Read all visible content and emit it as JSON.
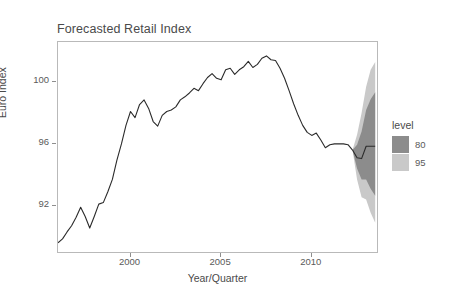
{
  "chart_data": {
    "type": "line",
    "title": "Forecasted Retail Index",
    "xlabel": "Year/Quarter",
    "ylabel": "Euro Index",
    "xlim": [
      1996.0,
      1913.5
    ],
    "x_range": [
      1996.0,
      2013.6
    ],
    "ylim": [
      89.0,
      102.6
    ],
    "xticks": [
      2000,
      2005,
      2010
    ],
    "xtick_labels": [
      "2000",
      "2005",
      "2010"
    ],
    "yticks": [
      92,
      96,
      100
    ],
    "ytick_labels": [
      "92",
      "96",
      "100"
    ],
    "grid": false,
    "legend": {
      "title": "level",
      "position": "right",
      "entries": [
        {
          "label": "80",
          "color": "#8c8c8c"
        },
        {
          "label": "95",
          "color": "#c9c9c9"
        }
      ]
    },
    "series": [
      {
        "name": "Euro Index (historical)",
        "color": "#2b2b2b",
        "x": [
          1996.0,
          1996.25,
          1996.5,
          1996.75,
          1997.0,
          1997.25,
          1997.5,
          1997.75,
          1998.0,
          1998.25,
          1998.5,
          1998.75,
          1999.0,
          1999.25,
          1999.5,
          1999.75,
          2000.0,
          2000.25,
          2000.5,
          2000.75,
          2001.0,
          2001.25,
          2001.5,
          2001.75,
          2002.0,
          2002.25,
          2002.5,
          2002.75,
          2003.0,
          2003.25,
          2003.5,
          2003.75,
          2004.0,
          2004.25,
          2004.5,
          2004.75,
          2005.0,
          2005.25,
          2005.5,
          2005.75,
          2006.0,
          2006.25,
          2006.5,
          2006.75,
          2007.0,
          2007.25,
          2007.5,
          2007.75,
          2008.0,
          2008.25,
          2008.5,
          2008.75,
          2009.0,
          2009.25,
          2009.5,
          2009.75,
          2010.0,
          2010.25,
          2010.5,
          2010.75,
          2011.0,
          2011.25,
          2011.5,
          2011.75,
          2012.0,
          2012.25
        ],
        "y": [
          89.6,
          89.85,
          90.3,
          90.7,
          91.25,
          91.9,
          91.3,
          90.55,
          91.3,
          92.1,
          92.2,
          92.9,
          93.7,
          94.95,
          96.0,
          97.2,
          98.1,
          97.7,
          98.55,
          98.85,
          98.3,
          97.45,
          97.15,
          97.85,
          98.1,
          98.2,
          98.4,
          98.85,
          99.05,
          99.3,
          99.6,
          99.45,
          99.9,
          100.3,
          100.55,
          100.25,
          100.15,
          100.8,
          100.9,
          100.5,
          100.8,
          101.0,
          101.35,
          100.95,
          101.15,
          101.55,
          101.7,
          101.45,
          101.4,
          100.9,
          100.25,
          99.45,
          98.6,
          97.85,
          97.2,
          96.75,
          96.55,
          96.7,
          96.25,
          95.75,
          95.95,
          96.0,
          96.0,
          96.0,
          95.95,
          95.6
        ]
      },
      {
        "name": "Forecast (point)",
        "color": "#2b2b2b",
        "x": [
          2012.25,
          2012.5,
          2012.75,
          2013.0,
          2013.25,
          2013.5
        ],
        "y": [
          95.6,
          95.1,
          95.05,
          95.85,
          95.85,
          95.85
        ]
      }
    ],
    "intervals": [
      {
        "level": 95,
        "color": "#c9c9c9",
        "x": [
          2012.25,
          2012.5,
          2012.75,
          2013.0,
          2013.25,
          2013.5
        ],
        "lower": [
          95.6,
          93.7,
          92.55,
          92.4,
          91.55,
          90.9
        ],
        "upper": [
          95.6,
          96.6,
          98.0,
          99.7,
          100.8,
          101.3
        ]
      },
      {
        "level": 80,
        "color": "#8c8c8c",
        "x": [
          2012.25,
          2012.5,
          2012.75,
          2013.0,
          2013.25,
          2013.5
        ],
        "lower": [
          95.6,
          94.4,
          93.7,
          93.7,
          93.1,
          92.65
        ],
        "upper": [
          95.6,
          95.95,
          96.8,
          98.2,
          98.9,
          99.35
        ]
      }
    ]
  }
}
